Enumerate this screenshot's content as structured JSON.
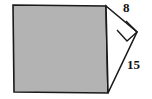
{
  "figure": {
    "type": "geometry-diagram",
    "background_color": "#ffffff",
    "square": {
      "name": "shaded-square",
      "fill_color": "#b3b3b3",
      "stroke_color": "#1a1a1a",
      "stroke_width": 1.6,
      "points": "13,5 106,6 108,93 14,92"
    },
    "triangle": {
      "name": "right-triangle",
      "fill_color": "#ffffff",
      "stroke_color": "#1a1a1a",
      "stroke_width": 1.6,
      "points": "106,6 137,32 108,93"
    },
    "right_angle_marker": {
      "name": "right-angle-marker",
      "stroke_color": "#1a1a1a",
      "stroke_width": 1.4,
      "points": "126,21 137,32 127,41 117,30"
    },
    "labels": {
      "short_leg": "8",
      "long_leg": "15"
    }
  }
}
